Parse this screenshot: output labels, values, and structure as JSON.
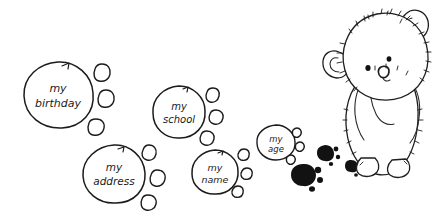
{
  "illustration": {
    "title": "my personal information paw print trail",
    "medium": "hand-drawn pen sketch",
    "background_color": "#ffffff",
    "ink_color": "#1b1b1b",
    "fill_color": "#121212"
  },
  "bear": {
    "name": "teddy-bear",
    "description": "fuzzy teddy bear standing and looking down at paw prints",
    "parts": {
      "head": "head",
      "left_ear": "left ear",
      "right_ear": "right ear",
      "left_eye": "left eye",
      "right_eye": "right eye",
      "muzzle": "nose and muzzle",
      "body": "body",
      "left_arm": "left arm",
      "right_arm": "right arm",
      "left_foot": "left foot",
      "right_foot": "right foot"
    }
  },
  "paw_trail": {
    "description": "trail of paw prints leading away from the bear, each pad labelled with a piece of personal information",
    "prints": [
      {
        "id": "print-birthday",
        "label": "my birthday",
        "label_line_1": "my",
        "label_line_2": "birthday",
        "style": "outline",
        "pad": {
          "cx": 58,
          "cy": 95,
          "rx": 35,
          "ry": 33
        },
        "font_size": 11,
        "toes": [
          {
            "cx": 102,
            "cy": 73,
            "rx": 8,
            "ry": 8.5
          },
          {
            "cx": 106,
            "cy": 99,
            "rx": 8.5,
            "ry": 8.5
          },
          {
            "cx": 96,
            "cy": 127,
            "rx": 8.5,
            "ry": 8
          }
        ]
      },
      {
        "id": "print-address",
        "label": "my address",
        "label_line_1": "my",
        "label_line_2": "address",
        "style": "outline",
        "pad": {
          "cx": 114,
          "cy": 174,
          "rx": 31,
          "ry": 29
        },
        "font_size": 10.5,
        "toes": [
          {
            "cx": 149,
            "cy": 153,
            "rx": 7.5,
            "ry": 8
          },
          {
            "cx": 157,
            "cy": 178,
            "rx": 8,
            "ry": 8
          },
          {
            "cx": 148,
            "cy": 202,
            "rx": 8,
            "ry": 7.5
          }
        ]
      },
      {
        "id": "print-school",
        "label": "my school",
        "label_line_1": "my",
        "label_line_2": "school",
        "style": "outline",
        "pad": {
          "cx": 179,
          "cy": 112,
          "rx": 26,
          "ry": 26
        },
        "font_size": 10,
        "toes": [
          {
            "cx": 213,
            "cy": 95,
            "rx": 7,
            "ry": 7.5
          },
          {
            "cx": 216,
            "cy": 117,
            "rx": 7.5,
            "ry": 7.5
          },
          {
            "cx": 207,
            "cy": 138,
            "rx": 7.5,
            "ry": 7
          }
        ]
      },
      {
        "id": "print-name",
        "label": "my name",
        "label_line_1": "my",
        "label_line_2": "name",
        "style": "outline",
        "pad": {
          "cx": 215,
          "cy": 172,
          "rx": 23,
          "ry": 22
        },
        "font_size": 9.5,
        "toes": [
          {
            "cx": 244,
            "cy": 155,
            "rx": 6.5,
            "ry": 6.5
          },
          {
            "cx": 247,
            "cy": 174,
            "rx": 6.5,
            "ry": 6.5
          },
          {
            "cx": 238,
            "cy": 192,
            "rx": 6.5,
            "ry": 6
          }
        ]
      },
      {
        "id": "print-age",
        "label": "my age",
        "label_line_1": "my",
        "label_line_2": "age",
        "style": "outline",
        "pad": {
          "cx": 276,
          "cy": 142,
          "rx": 19,
          "ry": 17
        },
        "font_size": 8.5,
        "toes": [
          {
            "cx": 297,
            "cy": 134,
            "rx": 5,
            "ry": 5.5
          },
          {
            "cx": 300,
            "cy": 148,
            "rx": 5,
            "ry": 5
          },
          {
            "cx": 291,
            "cy": 161,
            "rx": 5,
            "ry": 4.5
          }
        ]
      },
      {
        "id": "print-filled-large",
        "label": "",
        "style": "filled",
        "pad": {
          "cx": 303,
          "cy": 175,
          "rx": 12,
          "ry": 11
        },
        "toes": [
          {
            "cx": 318,
            "cy": 170,
            "rx": 3.2,
            "ry": 3.2
          },
          {
            "cx": 320,
            "cy": 180,
            "rx": 3,
            "ry": 3
          },
          {
            "cx": 312,
            "cy": 189,
            "rx": 3,
            "ry": 2.8
          }
        ]
      },
      {
        "id": "print-filled-mid",
        "label": "",
        "style": "filled",
        "pad": {
          "cx": 325,
          "cy": 153,
          "rx": 8,
          "ry": 7.5
        },
        "toes": [
          {
            "cx": 336,
            "cy": 149,
            "rx": 2.4,
            "ry": 2.4
          },
          {
            "cx": 338,
            "cy": 157,
            "rx": 2.2,
            "ry": 2.2
          },
          {
            "cx": 331,
            "cy": 164,
            "rx": 2.2,
            "ry": 2
          }
        ]
      },
      {
        "id": "print-filled-small",
        "label": "",
        "style": "filled",
        "pad": {
          "cx": 351,
          "cy": 166,
          "rx": 6.5,
          "ry": 6
        },
        "toes": [
          {
            "cx": 360,
            "cy": 162,
            "rx": 2,
            "ry": 2
          },
          {
            "cx": 362,
            "cy": 169,
            "rx": 1.9,
            "ry": 1.9
          },
          {
            "cx": 356,
            "cy": 175,
            "rx": 1.9,
            "ry": 1.8
          }
        ]
      }
    ]
  }
}
